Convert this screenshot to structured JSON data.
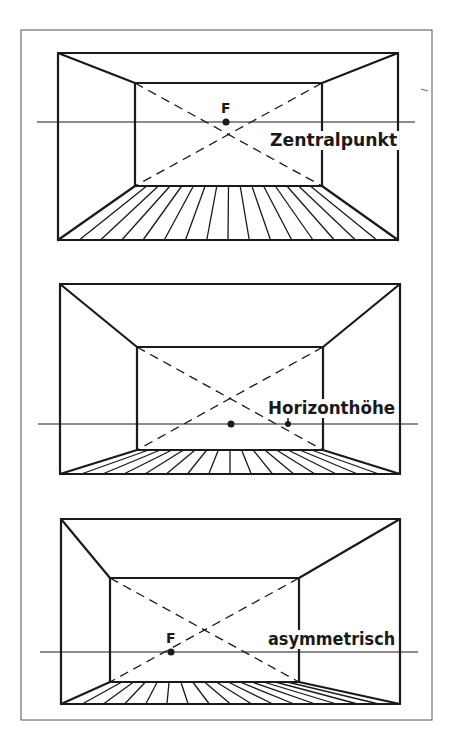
{
  "figure": {
    "frame": {
      "x": 21,
      "y": 30,
      "w": 411,
      "h": 690
    },
    "panels": [
      {
        "id": "zentralpunkt",
        "label": "Zentralpunkt",
        "vp_label": "F",
        "outer": {
          "x1": 58,
          "y1": 53,
          "x2": 398,
          "y2": 240
        },
        "inner": {
          "x1": 135,
          "y1": 83,
          "x2": 322,
          "y2": 186
        },
        "vanishing_point": {
          "x": 226,
          "y": 122
        },
        "horizon": {
          "y": 122,
          "x1": 37,
          "x2": 415
        },
        "floor_divisions": 16,
        "label_pos": {
          "x": 270,
          "y": 146
        },
        "vp_label_pos": {
          "x": 221,
          "y": 113
        },
        "extra_dot": null
      },
      {
        "id": "horizonthoehe",
        "label": "Horizonthöhe",
        "vp_label": "",
        "outer": {
          "x1": 60,
          "y1": 284,
          "x2": 400,
          "y2": 474
        },
        "inner": {
          "x1": 137,
          "y1": 347,
          "x2": 323,
          "y2": 450
        },
        "vanishing_point": {
          "x": 231,
          "y": 424
        },
        "horizon": {
          "y": 424,
          "x1": 38,
          "x2": 418
        },
        "floor_divisions": 16,
        "label_pos": {
          "x": 268,
          "y": 414
        },
        "vp_label_pos": null,
        "extra_dot": {
          "x": 288,
          "y": 424
        }
      },
      {
        "id": "asymmetrisch",
        "label": "asymmetrisch",
        "vp_label": "F",
        "outer": {
          "x1": 61,
          "y1": 519,
          "x2": 400,
          "y2": 704
        },
        "inner": {
          "x1": 110,
          "y1": 578,
          "x2": 299,
          "y2": 682
        },
        "vanishing_point": {
          "x": 171,
          "y": 652
        },
        "horizon": {
          "y": 652,
          "x1": 40,
          "x2": 418
        },
        "floor_divisions": 16,
        "label_pos": {
          "x": 268,
          "y": 645
        },
        "vp_label_pos": {
          "x": 166,
          "y": 643
        },
        "extra_dot": null
      }
    ]
  }
}
